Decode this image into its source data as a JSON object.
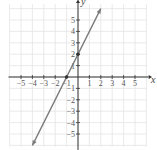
{
  "chart_data": {
    "type": "line",
    "title": "",
    "xlabel": "x",
    "ylabel": "y",
    "xlim": [
      -6,
      6
    ],
    "ylim": [
      -6,
      6
    ],
    "grid": true,
    "x_ticks": [
      "-5",
      "-4",
      "-3",
      "-2",
      "-1",
      "1",
      "2",
      "3",
      "4",
      "5"
    ],
    "y_ticks": [
      "5",
      "4",
      "3",
      "2",
      "1",
      "-1",
      "-2",
      "-3",
      "-4",
      "-5"
    ],
    "series": [
      {
        "name": "y = 2x + 2",
        "equation": "y = 2x + 2",
        "x": [
          -4,
          2
        ],
        "y": [
          -6,
          6
        ],
        "arrows": "both",
        "color": "#777777"
      }
    ],
    "points": [
      {
        "x": 0,
        "y": 2
      },
      {
        "x": -1,
        "y": 0
      }
    ]
  },
  "colors": {
    "grid": "#e4e4e4",
    "axis": "#333333",
    "line": "#7a7a7a",
    "point": "#333333"
  }
}
